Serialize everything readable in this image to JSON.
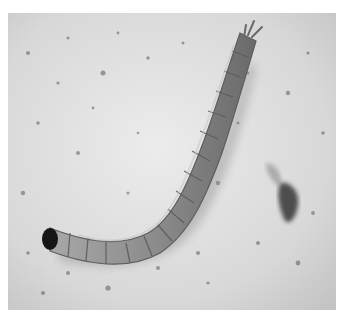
{
  "image": {
    "subject": "insect larva on textured light surface",
    "tone": "grayscale",
    "colors": {
      "background_surface": "#dcdcdc",
      "surface_light": "#ececec",
      "larva_body": "#8f8f8f",
      "larva_shadow": "#6e6e6e",
      "larva_head": "#1a1a1a",
      "speckle_dark": "#4a4a4a",
      "border": "#ffffff"
    }
  }
}
